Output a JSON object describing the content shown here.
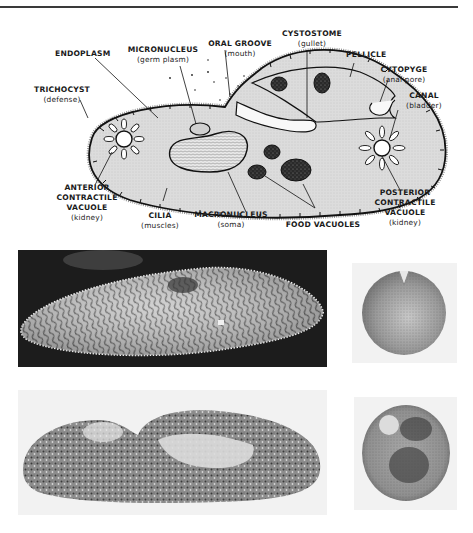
{
  "figure": {
    "labels": [
      {
        "id": "endoplasm",
        "title": "ENDOPLASM",
        "note": ""
      },
      {
        "id": "micronucleus",
        "title": "MICRONUCLEUS",
        "note": "(germ plasm)"
      },
      {
        "id": "oral-groove",
        "title": "ORAL GROOVE",
        "note": "(mouth)"
      },
      {
        "id": "cystostome",
        "title": "CYSTOSTOME",
        "note": "(gullet)"
      },
      {
        "id": "pellicle",
        "title": "PELLICLE",
        "note": ""
      },
      {
        "id": "cytopyge",
        "title": "CYTOPYGE",
        "note": "(anal pore)"
      },
      {
        "id": "canal",
        "title": "CANAL",
        "note": "(bladder)"
      },
      {
        "id": "trichocyst",
        "title": "TRICHOCYST",
        "note": "(defense)"
      },
      {
        "id": "anterior-cv",
        "title": "ANTERIOR",
        "title2": "CONTRACTILE",
        "title3": "VACUOLE",
        "note": "(kidney)"
      },
      {
        "id": "cilia",
        "title": "CILIA",
        "note": "(muscles)"
      },
      {
        "id": "macronucleus",
        "title": "MACRONUCLEUS",
        "note": "(soma)"
      },
      {
        "id": "food-vacuoles",
        "title": "FOOD VACUOLES",
        "note": ""
      },
      {
        "id": "posterior-cv",
        "title": "POSTERIOR",
        "title2": "CONTRACTILE",
        "title3": "VACUOLE",
        "note": "(kidney)"
      }
    ]
  },
  "photos": [
    {
      "id": "sem-longitudinal",
      "description": "scanning electron micrograph, longitudinal view"
    },
    {
      "id": "section-cross-1",
      "description": "cross section"
    },
    {
      "id": "section-longitudinal",
      "description": "light micrograph, longitudinal section"
    },
    {
      "id": "section-cross-2",
      "description": "cross section"
    }
  ],
  "colors": {
    "ink": "#1a1a1a",
    "cytoplasm": "#dedede",
    "background": "#ffffff",
    "photo_dark": "#1c1c1c"
  }
}
